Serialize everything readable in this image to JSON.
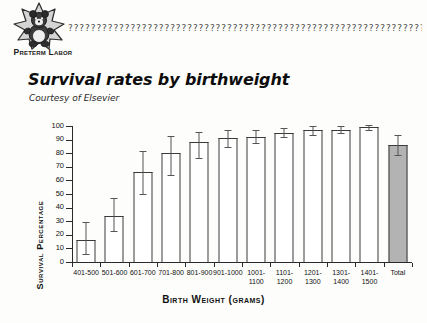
{
  "header": {
    "logo_caption": "Preterm Labor",
    "logo_icon": "bear-on-starburst",
    "dingbat_rule": "???????????????????????????????????????????????????????????????????????????"
  },
  "title": "Survival rates by birthweight",
  "subtitle": "Courtesy of Elsevier",
  "colors": {
    "page_background": "#fdfdfb",
    "bar_fill": "#ffffff",
    "total_bar_fill": "#b3b3b3",
    "bar_stroke": "#3a3a3a",
    "axis": "#2a2a2a",
    "error_bar": "#555555",
    "text": "#111111"
  },
  "chart_data": {
    "type": "bar",
    "title": "Survival rates by birthweight",
    "subtitle": "Courtesy of Elsevier",
    "xlabel": "Birth Weight (grams)",
    "ylabel": "Survival Percentage",
    "ylim": [
      0,
      100
    ],
    "yticks": [
      0,
      10,
      20,
      30,
      40,
      50,
      60,
      70,
      80,
      90,
      100
    ],
    "grid": false,
    "legend": "none",
    "categories": [
      "401-500",
      "501-600",
      "601-700",
      "701-800",
      "801-900",
      "901-1000",
      "1001-1100",
      "1101-1200",
      "1201-1300",
      "1301-1400",
      "1401-1500",
      "Total"
    ],
    "category_lines": [
      [
        "401-500"
      ],
      [
        "501-600"
      ],
      [
        "601-700"
      ],
      [
        "701-800"
      ],
      [
        "801-900"
      ],
      [
        "901-1000"
      ],
      [
        "1001-",
        "1100"
      ],
      [
        "1101-",
        "1200"
      ],
      [
        "1201-",
        "1300"
      ],
      [
        "1301-",
        "1400"
      ],
      [
        "1401-",
        "1500"
      ],
      [
        "Total"
      ]
    ],
    "values": [
      16,
      34,
      66,
      80,
      88,
      91,
      92,
      95,
      97,
      97,
      99,
      86
    ],
    "error_low": [
      5,
      22,
      49,
      63,
      76,
      84,
      87,
      91,
      93,
      94,
      96,
      78
    ],
    "error_high": [
      29,
      46,
      81,
      92,
      95,
      96,
      96,
      98,
      99,
      99,
      100,
      93
    ],
    "highlighted_category": "Total"
  }
}
